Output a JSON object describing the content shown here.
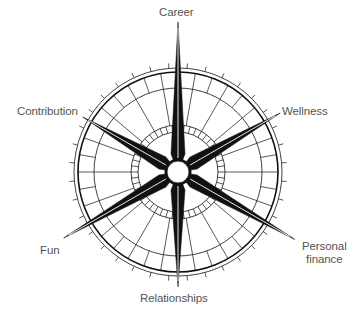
{
  "diagram": {
    "type": "compass",
    "center": {
      "x": 178,
      "y": 172
    },
    "colors": {
      "ink": "#111111",
      "label": "#555555",
      "background": "#ffffff"
    },
    "rings": {
      "outer_thin_radius": 104,
      "outer_thick_radius": 100,
      "band_inner_radius": 84,
      "inner_band_outer_radius": 47,
      "inner_band_inner_radius": 40,
      "hub_radius": 11
    },
    "spokes": [
      {
        "name": "Career",
        "angle_deg": 0,
        "length": 150
      },
      {
        "name": "Wellness",
        "angle_deg": 60,
        "length": 118
      },
      {
        "name": "Personal finance",
        "angle_deg": 120,
        "length": 135
      },
      {
        "name": "Relationships",
        "angle_deg": 180,
        "length": 115
      },
      {
        "name": "Fun",
        "angle_deg": 240,
        "length": 132
      },
      {
        "name": "Contribution",
        "angle_deg": 300,
        "length": 110
      }
    ]
  },
  "labels": {
    "career": "Career",
    "wellness": "Wellness",
    "personal_finance_line1": "Personal",
    "personal_finance_line2": "finance",
    "relationships": "Relationships",
    "fun": "Fun",
    "contribution": "Contribution"
  }
}
